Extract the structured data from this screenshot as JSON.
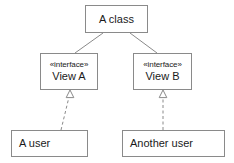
{
  "diagram": {
    "kind": "uml-class-diagram",
    "stroke_color": "#8a8a8a",
    "text_color": "#1a1a1a",
    "background_color": "#ffffff",
    "nodes": {
      "a_class": {
        "label": "A class",
        "stereotype": ""
      },
      "view_a": {
        "stereotype": "«interface»",
        "label": "View A"
      },
      "view_b": {
        "stereotype": "«interface»",
        "label": "View B"
      },
      "a_user": {
        "label": "A user",
        "stereotype": ""
      },
      "another_user": {
        "label": "Another user",
        "stereotype": ""
      }
    },
    "edges": [
      {
        "name": "a-class-to-view-a",
        "from": "a_class",
        "to": "view_a",
        "style": "solid",
        "arrowhead": "none"
      },
      {
        "name": "a-class-to-view-b",
        "from": "a_class",
        "to": "view_b",
        "style": "solid",
        "arrowhead": "none"
      },
      {
        "name": "a-user-realizes-view-a",
        "from": "a_user",
        "to": "view_a",
        "style": "dashed",
        "arrowhead": "hollow-triangle"
      },
      {
        "name": "another-user-realizes-view-b",
        "from": "another_user",
        "to": "view_b",
        "style": "dashed",
        "arrowhead": "hollow-triangle"
      }
    ]
  }
}
